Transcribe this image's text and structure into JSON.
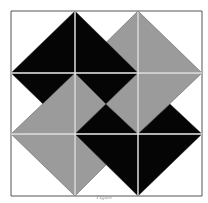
{
  "diagram": {
    "type": "quilt-block",
    "grid": {
      "rows": 3,
      "cols": 3,
      "x": [
        11,
        75,
        138,
        202
      ],
      "y": [
        11,
        73,
        134,
        196
      ]
    },
    "colors": {
      "black": "#050505",
      "gray": "#9b9b9b",
      "white": "#ffffff",
      "line": "#555555"
    },
    "shapes": [
      {
        "fill": "black",
        "points": "11,73 75,11 75,73"
      },
      {
        "fill": "gray",
        "points": "138,11 138,73 75,73"
      },
      {
        "fill": "black",
        "points": "75,11 75,73 138,73"
      },
      {
        "fill": "gray",
        "points": "138,11 138,73 202,73"
      },
      {
        "fill": "black",
        "points": "11,73 75,73 43,104"
      },
      {
        "fill": "gray",
        "points": "75,73 75,134 11,134"
      },
      {
        "fill": "gray",
        "points": "75,73 75,134 106,104"
      },
      {
        "fill": "black",
        "points": "75,73 138,73 106,104"
      },
      {
        "fill": "black",
        "points": "75,134 138,134 106,104"
      },
      {
        "fill": "gray",
        "points": "138,73 138,134 106,104"
      },
      {
        "fill": "gray",
        "points": "138,73 202,73 138,134"
      },
      {
        "fill": "black",
        "points": "202,134 138,134 170,104"
      },
      {
        "fill": "gray",
        "points": "11,134 75,134 75,196"
      },
      {
        "fill": "gray",
        "points": "75,134 75,196 106,165"
      },
      {
        "fill": "black",
        "points": "75,134 138,134 138,196"
      },
      {
        "fill": "black",
        "points": "138,134 202,134 138,196"
      }
    ]
  },
  "caption": "Figure"
}
